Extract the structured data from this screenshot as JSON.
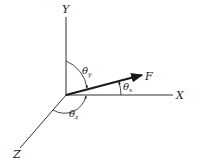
{
  "diagram": {
    "type": "3d-vector-direction-angles",
    "colors": {
      "stroke": "#1a1a1a",
      "background": "#ffffff"
    },
    "axes": {
      "x": {
        "label": "X"
      },
      "y": {
        "label": "Y"
      },
      "z": {
        "label": "Z"
      }
    },
    "vector": {
      "label": "F"
    },
    "angles": [
      {
        "symbol": "θ",
        "subscript": "x"
      },
      {
        "symbol": "θ",
        "subscript": "y"
      },
      {
        "symbol": "θ",
        "subscript": "z"
      }
    ]
  }
}
